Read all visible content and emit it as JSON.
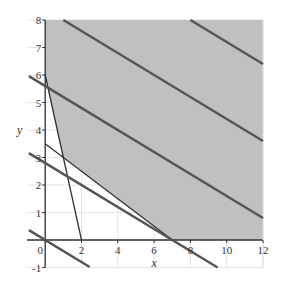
{
  "chart_data": {
    "type": "line",
    "title": "",
    "xlabel": "x",
    "ylabel": "y",
    "xlim": [
      -1,
      12
    ],
    "ylim": [
      -1,
      8
    ],
    "x_ticks": [
      0,
      2,
      4,
      6,
      8,
      10,
      12
    ],
    "y_ticks": [
      -1,
      1,
      2,
      3,
      4,
      5,
      6,
      7,
      8
    ],
    "grid": true,
    "legend": null,
    "feasible_region": {
      "description": "Shaded feasible region above constraints",
      "vertices": [
        [
          0,
          8
        ],
        [
          0,
          6
        ],
        [
          1,
          3
        ],
        [
          7,
          0
        ],
        [
          12,
          0
        ],
        [
          12,
          8
        ]
      ],
      "fill": "#c0c0c0"
    },
    "constraint_lines": [
      {
        "name": "3x + y = 6",
        "a": 3,
        "b": 1,
        "c": 6,
        "x_range": [
          0,
          2
        ],
        "style": "thin",
        "color": "#333333"
      },
      {
        "name": "x + 2y = 7",
        "a": 1,
        "b": 2,
        "c": 7,
        "x_range": [
          0,
          7
        ],
        "style": "thin",
        "color": "#333333"
      },
      {
        "name": "2x + 5y = 14",
        "a": 2,
        "b": 5,
        "c": 14,
        "x_range": [
          -0.9,
          9.5
        ],
        "style": "thick",
        "color": "#555555"
      }
    ],
    "objective_lines": [
      {
        "name": "2x + 5y = 0",
        "a": 2,
        "b": 5,
        "c": 0,
        "x_range": [
          -0.9,
          2.45
        ],
        "color": "#555555"
      },
      {
        "name": "2x + 5y = 28",
        "a": 2,
        "b": 5,
        "c": 28,
        "x_range": [
          -0.9,
          12
        ],
        "color": "#555555"
      },
      {
        "name": "2x + 5y = 42",
        "a": 2,
        "b": 5,
        "c": 42,
        "x_range": [
          1,
          12
        ],
        "color": "#555555"
      },
      {
        "name": "2x + 5y = 56",
        "a": 2,
        "b": 5,
        "c": 56,
        "x_range": [
          8,
          12
        ],
        "color": "#555555"
      }
    ]
  },
  "axes": {
    "x_label": "x",
    "y_label": "y",
    "x_tick_labels": [
      "0",
      "2",
      "4",
      "6",
      "8",
      "10",
      "12"
    ],
    "y_tick_labels": [
      "-1",
      "1",
      "2",
      "3",
      "4",
      "5",
      "6",
      "7",
      "8"
    ]
  }
}
